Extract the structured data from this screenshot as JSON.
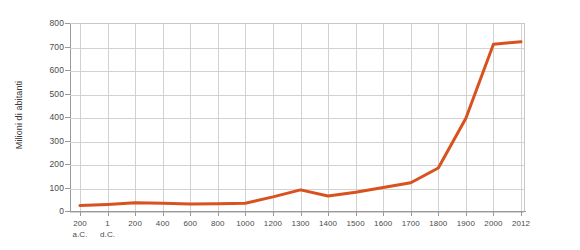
{
  "chart_data": {
    "type": "line",
    "title": "",
    "subtitle": "",
    "xlabel": "",
    "ylabel": "Milioni di abitanti",
    "ylim": [
      0,
      800
    ],
    "y_ticks": [
      0,
      100,
      200,
      300,
      400,
      500,
      600,
      700,
      800
    ],
    "grid": true,
    "legend": false,
    "legend_position": "none",
    "series": [
      {
        "name": "Popolazione",
        "color": "#d8511f",
        "values": [
          23,
          28,
          35,
          33,
          30,
          31,
          33,
          60,
          90,
          64,
          80,
          100,
          120,
          183,
          395,
          710,
          720
        ]
      }
    ],
    "categories": [
      "200 a.C.",
      "1 d.C.",
      "200",
      "400",
      "600",
      "800",
      "1000",
      "1200",
      "1300",
      "1400",
      "1500",
      "1600",
      "1700",
      "1800",
      "1900",
      "2000",
      "2012"
    ],
    "tick_labels": [
      {
        "main": "200",
        "sub": "a.C."
      },
      {
        "main": "1",
        "sub": "d.C."
      },
      {
        "main": "200",
        "sub": ""
      },
      {
        "main": "400",
        "sub": ""
      },
      {
        "main": "600",
        "sub": ""
      },
      {
        "main": "800",
        "sub": ""
      },
      {
        "main": "1000",
        "sub": ""
      },
      {
        "main": "1200",
        "sub": ""
      },
      {
        "main": "1300",
        "sub": ""
      },
      {
        "main": "1400",
        "sub": ""
      },
      {
        "main": "1500",
        "sub": ""
      },
      {
        "main": "1600",
        "sub": ""
      },
      {
        "main": "1700",
        "sub": ""
      },
      {
        "main": "1800",
        "sub": ""
      },
      {
        "main": "1900",
        "sub": ""
      },
      {
        "main": "2000",
        "sub": ""
      },
      {
        "main": "2012",
        "sub": ""
      }
    ]
  },
  "style": {
    "line_color": "#d8511f",
    "grid_color": "#d2d2d2",
    "axis_color": "#9a9a9a",
    "text_color": "#4a4a4a",
    "background": "#ffffff"
  }
}
